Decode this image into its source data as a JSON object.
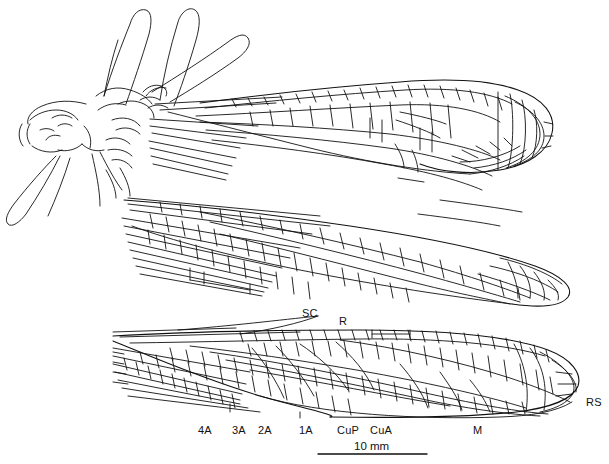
{
  "figure": {
    "kind": "scientific-line-drawing",
    "background_color": "#ffffff",
    "ink_color": "#111111",
    "title": "",
    "caption": ""
  },
  "labels": {
    "sc": "SC",
    "r": "R",
    "rs": "RS",
    "m": "M",
    "cua": "CuA",
    "cup": "CuP",
    "a1": "1A",
    "a2": "2A",
    "a3": "3A",
    "a4": "4A"
  },
  "scale_bar": {
    "caption": "10 mm",
    "value": 10,
    "unit": "mm",
    "pixel_length": 109
  },
  "parts": {
    "body": "body-outline",
    "forewing": "forewing-upper",
    "hindwing": "hindwing-middle",
    "detail_wing": "wing-detail-lower"
  }
}
